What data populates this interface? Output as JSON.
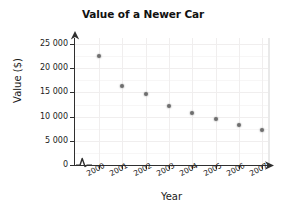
{
  "chart_data": {
    "type": "scatter",
    "title": "Value of a Newer Car",
    "xlabel": "Year",
    "ylabel": "Value ($)",
    "categories": [
      "2000",
      "2001",
      "2002",
      "2003",
      "2004",
      "2005",
      "2006",
      "2007"
    ],
    "x": [
      2000,
      2001,
      2002,
      2003,
      2004,
      2005,
      2006,
      2007
    ],
    "values": [
      22500,
      16300,
      14600,
      12200,
      10700,
      9500,
      8300,
      7200
    ],
    "series": [
      {
        "name": "Value of a Newer Car",
        "values": [
          22500,
          16300,
          14600,
          12200,
          10700,
          9500,
          8300,
          7200
        ]
      }
    ],
    "ylim": [
      0,
      27000
    ],
    "ytick_values": [
      0,
      5000,
      10000,
      15000,
      20000,
      25000
    ],
    "ytick_labels": [
      "0",
      "5 000",
      "10 000",
      "15 000",
      "20 000",
      "25 000"
    ],
    "xtick_labels": [
      "2000",
      "2001",
      "2002",
      "2003",
      "2004",
      "2005",
      "2006",
      "2007"
    ],
    "grid": true,
    "legend": false,
    "x_axis_break": true,
    "marker_color": "#6e6e6e",
    "axis_color": "#2f2f2f",
    "grid_color": "#f0eeee",
    "background_color": "#ffffff"
  }
}
